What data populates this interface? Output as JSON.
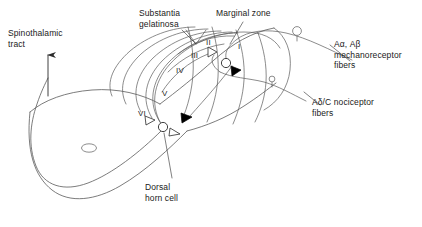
{
  "figure": {
    "title_visible": false,
    "background_color": "#ffffff",
    "line_color": "#555555",
    "text_color": "#1a1a1a",
    "accent_fill": "#000000"
  },
  "labels": {
    "spinothalamic_tract": "Spinothalamic\ntract",
    "substantia_gelatinosa": "Substantia\ngelatinosa",
    "marginal_zone": "Marginal zone",
    "dorsal_horn_cell": "Dorsal\nhorn cell",
    "mechanoreceptor_fibers": "Aα, Aβ\nmechanoreceptor\nfibers",
    "nociceptor_fibers": "Aδ/C nociceptor\nfibers"
  },
  "laminae": [
    {
      "numeral": "I",
      "x": 238,
      "y": 42
    },
    {
      "numeral": "II",
      "x": 206,
      "y": 38
    },
    {
      "numeral": "III",
      "x": 191,
      "y": 51
    },
    {
      "numeral": "IV",
      "x": 176,
      "y": 66
    },
    {
      "numeral": "V",
      "x": 162,
      "y": 89
    },
    {
      "numeral": "VI",
      "x": 138,
      "y": 109
    }
  ],
  "structures": [
    {
      "name": "dorsal-horn-cell-soma",
      "type": "circle",
      "cx": 163,
      "cy": 127,
      "r": 4.6
    },
    {
      "name": "interneuron-soma",
      "type": "circle",
      "cx": 226,
      "cy": 63,
      "r": 4.6
    },
    {
      "name": "central-canal",
      "type": "ellipse",
      "cx": 89,
      "cy": 148,
      "rx": 7.5,
      "ry": 4.2
    },
    {
      "name": "drg-cell-mechanoreceptor",
      "type": "circle",
      "cx": 297,
      "cy": 31,
      "r": 4.4
    },
    {
      "name": "drg-cell-nociceptor",
      "type": "circle",
      "cx": 272,
      "cy": 79,
      "r": 2.9
    }
  ],
  "synapses": [
    {
      "name": "synapse-open-upper",
      "style": "open",
      "x": 212,
      "y": 52
    },
    {
      "name": "synapse-filled-upper",
      "style": "filled",
      "x": 236,
      "y": 71
    },
    {
      "name": "synapse-open-lower-left",
      "style": "open",
      "x": 150,
      "y": 120
    },
    {
      "name": "synapse-open-lower-right",
      "style": "open",
      "x": 174,
      "y": 132
    },
    {
      "name": "synapse-filled-lower",
      "style": "filled",
      "x": 186,
      "y": 118
    }
  ]
}
